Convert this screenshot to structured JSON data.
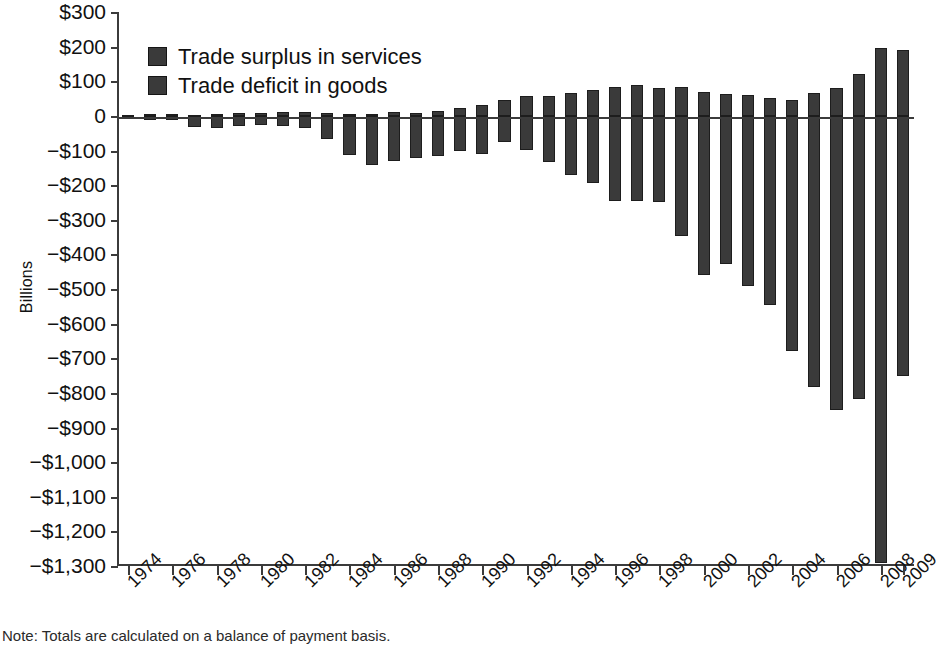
{
  "chart_data": {
    "type": "bar",
    "title": "",
    "subtitle": "",
    "xlabel": "",
    "ylabel": "Billions",
    "ylim": [
      -1300,
      300
    ],
    "ytick_step": 100,
    "grid": false,
    "legend_position": "top-left",
    "note": "Note: Totals are calculated on a balance of payment basis.",
    "categories": [
      "1974",
      "1975",
      "1976",
      "1977",
      "1978",
      "1979",
      "1980",
      "1981",
      "1982",
      "1983",
      "1984",
      "1985",
      "1986",
      "1987",
      "1988",
      "1989",
      "1990",
      "1991",
      "1992",
      "1993",
      "1994",
      "1995",
      "1996",
      "1997",
      "1998",
      "1999",
      "2000",
      "2001",
      "2002",
      "2003",
      "2004",
      "2005",
      "2006",
      "2007",
      "2008",
      "2009"
    ],
    "x_tick_labels": [
      "1974",
      "1976",
      "1978",
      "1980",
      "1982",
      "1984",
      "1986",
      "1988",
      "1990",
      "1992",
      "1994",
      "1996",
      "1998",
      "2000",
      "2002",
      "2004",
      "2006",
      "2008",
      "2009"
    ],
    "y_tick_labels": [
      "$300",
      "$200",
      "$100",
      "0",
      "−$100",
      "−$200",
      "−$300",
      "−$400",
      "−$500",
      "−$600",
      "−$700",
      "−$800",
      "−$900",
      "−$1,000",
      "−$1,100",
      "−$1,200",
      "−$1,300"
    ],
    "y_tick_values": [
      300,
      200,
      100,
      0,
      -100,
      -200,
      -300,
      -400,
      -500,
      -600,
      -700,
      -800,
      -900,
      -1000,
      -1100,
      -1200,
      -1300
    ],
    "series": [
      {
        "name": "Trade surplus in services",
        "color": "#3a3a3a",
        "values": [
          3,
          4,
          4,
          3,
          5,
          7,
          8,
          10,
          10,
          9,
          5,
          5,
          10,
          8,
          15,
          24,
          30,
          45,
          56,
          58,
          67,
          74,
          83,
          88,
          81,
          82,
          69,
          64,
          59,
          52,
          45,
          67,
          80,
          120,
          195,
          190
        ]
      },
      {
        "name": "Trade deficit in goods",
        "color": "#3a3a3a",
        "values": [
          -6,
          -9,
          -9,
          -31,
          -34,
          -28,
          -26,
          -28,
          -36,
          -67,
          -113,
          -122,
          -145,
          -160,
          -127,
          -116,
          -111,
          -77,
          -97,
          -133,
          -166,
          -174,
          -191,
          -198,
          -248,
          -346,
          -452,
          -427,
          -482,
          -547,
          -665,
          -783,
          -838,
          -819,
          -840,
          -517
        ]
      }
    ],
    "series_plot_values": [
      {
        "name": "Trade surplus in services",
        "values": [
          3,
          4,
          4,
          3,
          5,
          7,
          8,
          10,
          10,
          9,
          5,
          5,
          10,
          8,
          15,
          24,
          30,
          45,
          56,
          58,
          67,
          74,
          83,
          88,
          81,
          82,
          69,
          64,
          59,
          52,
          45,
          67,
          80,
          120,
          195,
          190
        ]
      },
      {
        "name": "Trade deficit in goods",
        "values": [
          -6,
          -12,
          -12,
          -32,
          -34,
          -28,
          -26,
          -28,
          -36,
          -67,
          -113,
          -142,
          -131,
          -122,
          -115,
          -100,
          -110,
          -75,
          -98,
          -132,
          -172,
          -195,
          -245,
          -245,
          -248,
          -346,
          -460,
          -427,
          -490,
          -547,
          -680,
          -783,
          -850,
          -819,
          -1290,
          -750
        ]
      }
    ],
    "highlight_notes": {
      "deepest_deficit_year": "2008",
      "deepest_deficit_value": -1290,
      "largest_surplus_year": "2008",
      "largest_surplus_value": 195
    }
  },
  "legend": {
    "items": [
      {
        "label": "Trade surplus in services"
      },
      {
        "label": "Trade deficit in goods"
      }
    ]
  },
  "axes": {
    "y_title": "Billions"
  },
  "footer": {
    "note": "Note: Totals are calculated on a balance of payment basis."
  }
}
